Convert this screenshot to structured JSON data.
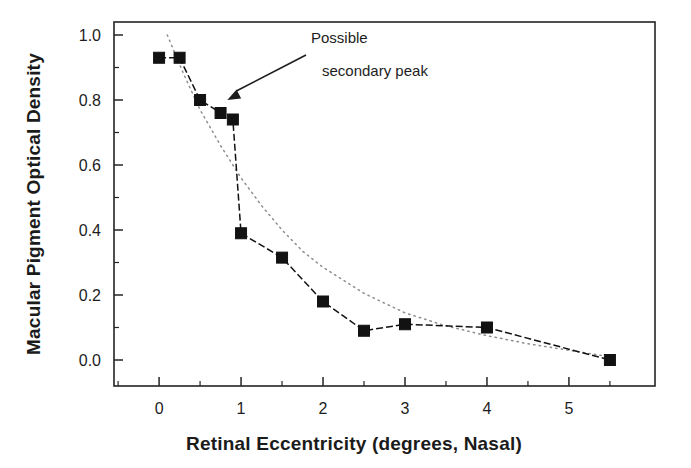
{
  "figure": {
    "background_color": "#ffffff",
    "ink_color": "#1d1d1d"
  },
  "chart_data": {
    "type": "scatter",
    "title": "",
    "xlabel": "Retinal Eccentricity (degrees, Nasal)",
    "ylabel": "Macular Pigment Optical Density",
    "xlim": [
      -0.55,
      6.05
    ],
    "ylim": [
      -0.08,
      1.04
    ],
    "xticks": [
      0,
      1,
      2,
      3,
      4,
      5
    ],
    "xtick_labels": [
      "0",
      "1",
      "2",
      "3",
      "4",
      "5"
    ],
    "xminor_ticks": [
      -0.5,
      0.5,
      1.5,
      2.5,
      3.5,
      4.5,
      5.5
    ],
    "yticks": [
      0.0,
      0.2,
      0.4,
      0.6,
      0.8,
      1.0
    ],
    "ytick_labels": [
      "0.0",
      "0.2",
      "0.4",
      "0.6",
      "0.8",
      "1.0"
    ],
    "yminor_ticks": [
      0.1,
      0.3,
      0.5,
      0.7,
      0.9
    ],
    "grid": false,
    "legend": false,
    "series": [
      {
        "name": "Measured macular pigment optical density",
        "style": "dashed line with filled square markers",
        "marker": "filled-square",
        "line_color": "#111111",
        "x": [
          0.0,
          0.25,
          0.5,
          0.75,
          0.9,
          1.0,
          1.5,
          2.0,
          2.5,
          3.0,
          4.0,
          5.5
        ],
        "y": [
          0.93,
          0.93,
          0.8,
          0.76,
          0.74,
          0.39,
          0.315,
          0.18,
          0.09,
          0.11,
          0.1,
          0.0
        ]
      },
      {
        "name": "Smooth reference profile",
        "style": "fine dotted line, no markers",
        "marker": "none",
        "line_color": "#8d8d8d",
        "x": [
          0.1,
          0.3,
          0.5,
          0.75,
          1.0,
          1.25,
          1.5,
          1.75,
          2.0,
          2.5,
          3.0,
          3.5,
          4.0,
          4.5,
          5.0,
          5.5
        ],
        "y": [
          1.0,
          0.88,
          0.77,
          0.66,
          0.56,
          0.475,
          0.4,
          0.335,
          0.285,
          0.205,
          0.145,
          0.105,
          0.075,
          0.05,
          0.03,
          0.01
        ]
      }
    ],
    "annotations": [
      {
        "text_line_1": "Possible",
        "text_line_2": "secondary peak",
        "points_to_x": 0.82,
        "points_to_y": 0.8
      }
    ]
  }
}
